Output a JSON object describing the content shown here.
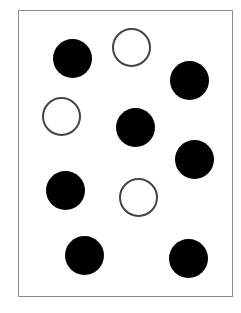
{
  "figure": {
    "frame": {
      "x": 18,
      "y": 10,
      "width": 214,
      "height": 286,
      "stroke": "#8a8a8a"
    },
    "circle_diameter": 39,
    "colors": {
      "filled": "#000000",
      "open_fill": "#ffffff",
      "open_stroke": "#444444"
    },
    "circles": [
      {
        "cx": 72,
        "cy": 58,
        "type": "filled"
      },
      {
        "cx": 131,
        "cy": 47,
        "type": "open"
      },
      {
        "cx": 189,
        "cy": 80,
        "type": "filled"
      },
      {
        "cx": 61,
        "cy": 116,
        "type": "open"
      },
      {
        "cx": 135,
        "cy": 127,
        "type": "filled"
      },
      {
        "cx": 194,
        "cy": 159,
        "type": "filled"
      },
      {
        "cx": 65,
        "cy": 190,
        "type": "filled"
      },
      {
        "cx": 138,
        "cy": 197,
        "type": "open"
      },
      {
        "cx": 84,
        "cy": 255,
        "type": "filled"
      },
      {
        "cx": 188,
        "cy": 258,
        "type": "filled"
      }
    ],
    "counts": {
      "filled": 7,
      "open": 3,
      "total": 10
    }
  }
}
